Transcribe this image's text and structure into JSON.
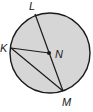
{
  "diagram": {
    "type": "circle-geometry",
    "circle": {
      "center_label": "N",
      "fill": "#d6d6d6",
      "stroke": "#1a1a1a"
    },
    "points": {
      "L": {
        "label": "L"
      },
      "K": {
        "label": "K"
      },
      "N": {
        "label": "N"
      },
      "M": {
        "label": "M"
      }
    },
    "segments": [
      "LM",
      "KN",
      "KM"
    ]
  }
}
